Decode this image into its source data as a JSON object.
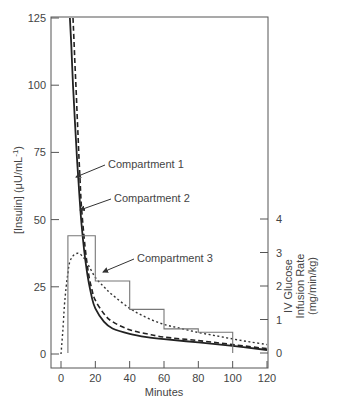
{
  "chart_data": {
    "type": "line",
    "title": "",
    "xlabel": "Minutes",
    "ylabel": "[Insulin] (μU/mL⁻¹)",
    "ylabel_parts": {
      "main": "[Insulin] (μU/mL",
      "sup": "-1",
      "close": ")"
    },
    "y2label_lines": [
      "IV Glucose",
      "Infusion Rate",
      "(mg/min/kg)"
    ],
    "xlim": [
      0,
      120
    ],
    "ylim": [
      0,
      125
    ],
    "y2lim": [
      0,
      4
    ],
    "x_ticks": [
      0,
      20,
      40,
      60,
      80,
      100,
      120
    ],
    "y_ticks": [
      0,
      25,
      50,
      75,
      100,
      125
    ],
    "y2_ticks": [
      0,
      1,
      2,
      3,
      4
    ],
    "grid": false,
    "series": [
      {
        "name": "Compartment 1",
        "style": "solid",
        "axis": "left",
        "x": [
          5.2,
          6,
          7,
          8,
          9,
          10,
          12,
          15,
          18,
          20,
          25,
          30,
          40,
          50,
          60,
          80,
          100,
          120
        ],
        "values": [
          125,
          115,
          100,
          88,
          76,
          66,
          48,
          31,
          21,
          17,
          12,
          9.5,
          7.5,
          6.3,
          5.5,
          4.3,
          3,
          1.5
        ]
      },
      {
        "name": "Compartment 2",
        "style": "dashed",
        "axis": "left",
        "x": [
          7,
          8,
          9,
          10,
          11,
          12,
          14,
          16,
          18,
          20,
          25,
          30,
          40,
          50,
          60,
          80,
          100,
          120
        ],
        "values": [
          125,
          110,
          95,
          80,
          66,
          54,
          40,
          30,
          24,
          20,
          15,
          12,
          9,
          7.5,
          6.3,
          5,
          3.5,
          2
        ]
      },
      {
        "name": "Compartment 3",
        "style": "dotted",
        "axis": "left",
        "x": [
          0,
          1,
          2,
          3,
          4,
          5,
          7,
          10,
          13,
          16,
          20,
          25,
          30,
          40,
          50,
          60,
          70,
          80,
          90,
          100,
          110,
          120
        ],
        "values": [
          0,
          8,
          18,
          25,
          30,
          34,
          36.5,
          37.5,
          36,
          33,
          28.5,
          25,
          22,
          17,
          13.5,
          11,
          9.5,
          8,
          6.8,
          5.6,
          4.5,
          3.5
        ]
      },
      {
        "name": "IV Glucose Infusion Rate",
        "style": "step",
        "axis": "right",
        "x": [
          4,
          4,
          20,
          20,
          40,
          40,
          60,
          60,
          80,
          80,
          100,
          100
        ],
        "values": [
          0,
          3.5,
          3.5,
          2.15,
          2.15,
          1.3,
          1.3,
          0.72,
          0.72,
          0.62,
          0.62,
          0
        ]
      }
    ],
    "annotations": [
      {
        "text": "Compartment 1",
        "text_xy": [
          108,
          168
        ],
        "arrow_from": [
          105,
          165
        ],
        "arrow_to": [
          76,
          177
        ]
      },
      {
        "text": "Compartment 2",
        "text_xy": [
          114,
          202
        ],
        "arrow_from": [
          111,
          199
        ],
        "arrow_to": [
          80,
          210
        ]
      },
      {
        "text": "Compartment 3",
        "text_xy": [
          137,
          262
        ],
        "arrow_from": [
          134,
          259
        ],
        "arrow_to": [
          103,
          272
        ]
      }
    ]
  }
}
